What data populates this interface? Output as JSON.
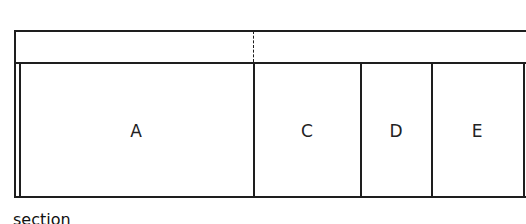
{
  "diagram": {
    "sections": [
      {
        "label": "A",
        "x_center": 136
      },
      {
        "label": "C",
        "x_center": 307
      },
      {
        "label": "D",
        "x_center": 396
      },
      {
        "label": "E",
        "x_center": 477
      }
    ],
    "caption": "section"
  }
}
